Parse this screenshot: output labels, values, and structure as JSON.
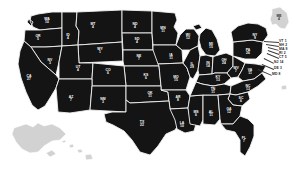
{
  "map": {
    "title": "United States apportionment map",
    "background_color": "#ffffff",
    "state_fill_color": "#141414",
    "state_border_color": "#f2f2f2",
    "inactive_fill_color": "#d2d2d2",
    "label_color": "#ffffff"
  },
  "states": [
    {
      "code": "WA",
      "value": "10",
      "x": 47,
      "y": 21,
      "active": true
    },
    {
      "code": "OR",
      "value": "5",
      "x": 38,
      "y": 38,
      "active": true
    },
    {
      "code": "ID",
      "value": "4",
      "x": 68,
      "y": 37,
      "active": true
    },
    {
      "code": "MT",
      "value": "4",
      "x": 93,
      "y": 26,
      "active": true
    },
    {
      "code": "WY",
      "value": "1",
      "x": 100,
      "y": 51,
      "active": true
    },
    {
      "code": "ND",
      "value": "4",
      "x": 135,
      "y": 26,
      "active": true
    },
    {
      "code": "SD",
      "value": "4",
      "x": 137,
      "y": 41,
      "active": true
    },
    {
      "code": "NE",
      "value": "7",
      "x": 139,
      "y": 58,
      "active": true
    },
    {
      "code": "KS",
      "value": "6",
      "x": 146,
      "y": 77,
      "active": true
    },
    {
      "code": "MN",
      "value": "11",
      "x": 163,
      "y": 30,
      "active": true
    },
    {
      "code": "IA",
      "value": "11",
      "x": 171,
      "y": 57,
      "active": true
    },
    {
      "code": "WI",
      "value": "12",
      "x": 188,
      "y": 37,
      "active": true
    },
    {
      "code": "MO",
      "value": "15",
      "x": 176,
      "y": 79,
      "active": true
    },
    {
      "code": "IL",
      "value": "29",
      "x": 192,
      "y": 66,
      "active": true
    },
    {
      "code": "MI",
      "value": "15",
      "x": 211,
      "y": 46,
      "active": true
    },
    {
      "code": "IN",
      "value": "14",
      "x": 208,
      "y": 65,
      "active": true
    },
    {
      "code": "OH",
      "value": "24",
      "x": 224,
      "y": 62,
      "active": true
    },
    {
      "code": "KY",
      "value": "13",
      "x": 218,
      "y": 79,
      "active": true
    },
    {
      "code": "WV",
      "value": "7",
      "x": 236,
      "y": 70,
      "active": true
    },
    {
      "code": "VA",
      "value": "11",
      "x": 250,
      "y": 72,
      "active": true
    },
    {
      "code": "PA",
      "value": "26",
      "x": 248,
      "y": 52,
      "active": true
    },
    {
      "code": "NY",
      "value": "9",
      "x": 255,
      "y": 37,
      "active": true
    },
    {
      "code": "NV",
      "value": "3",
      "x": 50,
      "y": 62,
      "active": true
    },
    {
      "code": "UT",
      "value": "4",
      "x": 78,
      "y": 69,
      "active": true
    },
    {
      "code": "CA",
      "value": "27",
      "x": 29,
      "y": 78,
      "active": true
    },
    {
      "code": "CO",
      "value": "6",
      "x": 108,
      "y": 72,
      "active": true
    },
    {
      "code": "AZ",
      "value": "7",
      "x": 71,
      "y": 99,
      "active": true
    },
    {
      "code": "NM",
      "value": "3",
      "x": 103,
      "y": 101,
      "active": true
    },
    {
      "code": "OK",
      "value": "11",
      "x": 150,
      "y": 95,
      "active": true
    },
    {
      "code": "AR",
      "value": "8",
      "x": 178,
      "y": 99,
      "active": true
    },
    {
      "code": "TX",
      "value": "22",
      "x": 142,
      "y": 124,
      "active": true
    },
    {
      "code": "LA",
      "value": "10",
      "x": 182,
      "y": 125,
      "active": true
    },
    {
      "code": "MS",
      "value": "6",
      "x": 196,
      "y": 114,
      "active": true
    },
    {
      "code": "AL",
      "value": "11",
      "x": 211,
      "y": 114,
      "active": true
    },
    {
      "code": "TN",
      "value": "11",
      "x": 213,
      "y": 91,
      "active": true
    },
    {
      "code": "NC",
      "value": "13",
      "x": 248,
      "y": 88,
      "active": true
    },
    {
      "code": "SC",
      "value": "6",
      "x": 241,
      "y": 100,
      "active": true
    },
    {
      "code": "GA",
      "value": "12",
      "x": 229,
      "y": 111,
      "active": true
    },
    {
      "code": "FL",
      "value": "7",
      "x": 244,
      "y": 140,
      "active": true
    },
    {
      "code": "ME",
      "value": "4",
      "x": 279,
      "y": 18,
      "active": false
    }
  ],
  "side_labels": [
    {
      "code": "VT",
      "value": "1",
      "x": 279,
      "y": 42,
      "tx": 264,
      "ty": 41
    },
    {
      "code": "NH",
      "value": "2",
      "x": 279,
      "y": 46,
      "tx": 266,
      "ty": 44
    },
    {
      "code": "MA",
      "value": "9",
      "x": 279,
      "y": 50,
      "tx": 268,
      "ty": 47
    },
    {
      "code": "RI",
      "value": "2",
      "x": 279,
      "y": 54,
      "tx": 268,
      "ty": 50
    },
    {
      "code": "CT",
      "value": "5",
      "x": 279,
      "y": 58,
      "tx": 267,
      "ty": 53
    },
    {
      "code": "NJ",
      "value": "14",
      "x": 274,
      "y": 63,
      "tx": 264,
      "ty": 58
    },
    {
      "code": "DE",
      "value": "3",
      "x": 274,
      "y": 69,
      "tx": 262,
      "ty": 64
    },
    {
      "code": "MD",
      "value": "8",
      "x": 272,
      "y": 75,
      "tx": 258,
      "ty": 69
    }
  ]
}
